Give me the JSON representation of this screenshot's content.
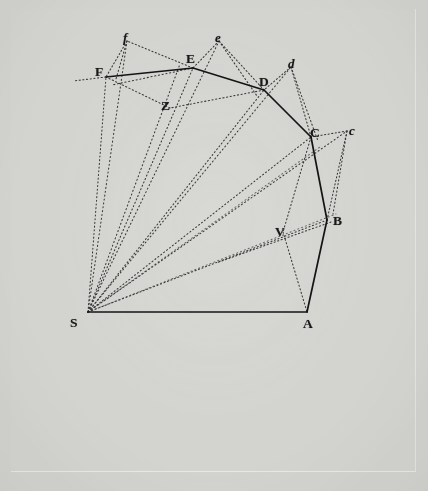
{
  "figure": {
    "background_color": "#d7d7d3",
    "plate_color": "#d8d8d4",
    "ink_color": "#1b1c1e",
    "solid_stroke_width": 1.6,
    "dotted_stroke_width": 1.0,
    "viewbox": "0 0 428 491"
  },
  "points": [
    {
      "id": "S",
      "label": "S",
      "style": "capital",
      "x": 88,
      "y": 312,
      "label_x": 70,
      "label_y": 323
    },
    {
      "id": "A",
      "label": "A",
      "style": "capital",
      "x": 307,
      "y": 312,
      "label_x": 303,
      "label_y": 330
    },
    {
      "id": "B",
      "label": "B",
      "style": "capital",
      "x": 327,
      "y": 220,
      "label_x": 333,
      "label_y": 225
    },
    {
      "id": "C",
      "label": "C",
      "style": "capital",
      "x": 311,
      "y": 137,
      "label_x": 310,
      "label_y": 134
    },
    {
      "id": "D",
      "label": "D",
      "style": "capital",
      "x": 264,
      "y": 90,
      "label_x": 261,
      "label_y": 83
    },
    {
      "id": "E",
      "label": "E",
      "style": "capital",
      "x": 193,
      "y": 68,
      "label_x": 187,
      "label_y": 61
    },
    {
      "id": "F",
      "label": "F",
      "style": "capital",
      "x": 106,
      "y": 77,
      "label_x": 97,
      "label_y": 75
    },
    {
      "id": "V",
      "label": "V",
      "style": "capital",
      "x": 283,
      "y": 232,
      "label_x": 276,
      "label_y": 236
    },
    {
      "id": "Z",
      "label": "Z",
      "style": "capital",
      "x": 170,
      "y": 108,
      "label_x": 163,
      "label_y": 110
    },
    {
      "id": "c",
      "label": "c",
      "style": "italic",
      "x": 347,
      "y": 131,
      "label_x": 350,
      "label_y": 131
    },
    {
      "id": "d",
      "label": "d",
      "style": "italic",
      "x": 291,
      "y": 67,
      "label_x": 290,
      "label_y": 66
    },
    {
      "id": "e",
      "label": "e",
      "style": "italic",
      "x": 219,
      "y": 41,
      "label_x": 216,
      "label_y": 40
    },
    {
      "id": "f",
      "label": "f",
      "style": "italic",
      "x": 127,
      "y": 41,
      "label_x": 124,
      "label_y": 40
    }
  ],
  "solid_edges": [
    {
      "name": "edge-S-A",
      "from": "S",
      "to": "A"
    },
    {
      "name": "edge-A-B",
      "from": "A",
      "to": "B"
    },
    {
      "name": "edge-B-C",
      "from": "B",
      "to": "C"
    },
    {
      "name": "edge-C-D",
      "from": "C",
      "to": "D"
    },
    {
      "name": "edge-D-E",
      "from": "D",
      "to": "E"
    },
    {
      "name": "edge-E-F",
      "from": "E",
      "to": "F"
    }
  ],
  "dotted_edges": [
    {
      "name": "radius-S-B",
      "from": "S",
      "to": "B"
    },
    {
      "name": "radius-S-C",
      "from": "S",
      "to": "C"
    },
    {
      "name": "radius-S-D",
      "from": "S",
      "to": "D"
    },
    {
      "name": "radius-S-E",
      "from": "S",
      "to": "E"
    },
    {
      "name": "radius-S-F",
      "from": "S",
      "to": "F"
    },
    {
      "name": "radius-S-c",
      "from": "S",
      "to": "c"
    },
    {
      "name": "radius-S-d",
      "from": "S",
      "to": "d"
    },
    {
      "name": "radius-S-e",
      "from": "S",
      "to": "e"
    },
    {
      "name": "radius-S-f",
      "from": "S",
      "to": "f"
    },
    {
      "name": "radius-S-Z",
      "from": "S",
      "to": "Z"
    },
    {
      "name": "tangent-B-c",
      "from": "B",
      "to": "c"
    },
    {
      "name": "tangent-C-d",
      "from": "C",
      "to": "d"
    },
    {
      "name": "tangent-D-e",
      "from": "D",
      "to": "e"
    },
    {
      "name": "tangent-E-f",
      "from": "E",
      "to": "f"
    },
    {
      "name": "impulse-c-C",
      "from": "c",
      "to": "C"
    },
    {
      "name": "impulse-d-D",
      "from": "d",
      "to": "D"
    },
    {
      "name": "impulse-e-E",
      "from": "e",
      "to": "E"
    },
    {
      "name": "impulse-f-F",
      "from": "f",
      "to": "F"
    },
    {
      "name": "chord-C-V",
      "from": "C",
      "to": "V"
    },
    {
      "name": "chord-V-A",
      "from": "V",
      "to": "A"
    },
    {
      "name": "chord-B-V-ext",
      "from": "B",
      "to": "V"
    },
    {
      "name": "chord-V-S",
      "from": "V",
      "to": "S"
    },
    {
      "name": "chord-D-Z",
      "from": "D",
      "to": "Z"
    },
    {
      "name": "chord-Z-F",
      "from": "Z",
      "to": "F"
    },
    {
      "name": "chord-E-Z-ext",
      "from": "E",
      "to": "Z"
    },
    {
      "name": "chord-F-left-ext",
      "from": "F",
      "to": "Fext"
    }
  ],
  "caption": ""
}
